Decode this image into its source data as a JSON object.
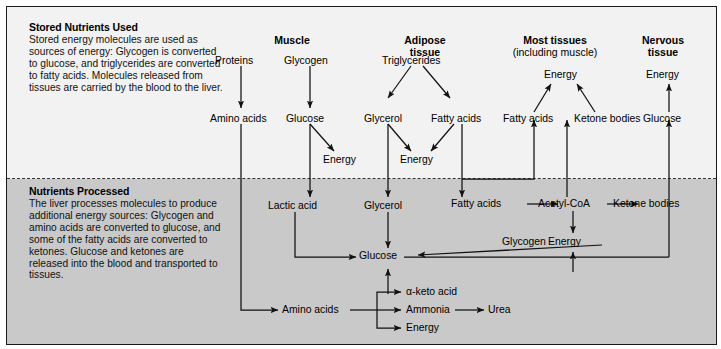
{
  "diagram": {
    "bands": {
      "top": {
        "heading": "Stored Nutrients Used",
        "body": "Stored energy molecules are used as sources of energy: Glycogen is converted to glucose, and triglycerides are converted to fatty acids. Molecules released from tissues are carried by the blood to the liver."
      },
      "bottom": {
        "heading": "Nutrients Processed",
        "body": "The liver processes molecules to produce additional energy sources: Glycogen and amino acids are converted to glucose, and some of the fatty acids are converted to ketones. Glucose and ketones are released into the blood and transported to tissues."
      }
    },
    "columns": [
      {
        "label": "Muscle",
        "sub": ""
      },
      {
        "label": "Adipose",
        "sub": "tissue"
      },
      {
        "label": "Most tissues",
        "sub": "(including muscle)"
      },
      {
        "label": "Nervous",
        "sub": "tissue"
      }
    ],
    "nodes": {
      "proteins": "Proteins",
      "glycogen_muscle": "Glycogen",
      "triglycerides": "Triglycerides",
      "energy_most": "Energy",
      "energy_nervous": "Energy",
      "amino_acids_top": "Amino acids",
      "glucose_muscle": "Glucose",
      "glycerol_top": "Glycerol",
      "fatty_acids_adipose": "Fatty acids",
      "fatty_acids_tissue": "Fatty acids",
      "ketone_bodies_tissue": "Ketone bodies",
      "glucose_nervous": "Glucose",
      "energy_glucose_muscle": "Energy",
      "energy_lipid": "Energy",
      "lactic_acid": "Lactic acid",
      "glycerol_liver": "Glycerol",
      "fatty_acids_liver": "Fatty acids",
      "acetyl_coa": "Acetyl-CoA",
      "ketone_bodies_liver": "Ketone bodies",
      "glycogen_liver": "Glycogen",
      "energy_liver": "Energy",
      "glucose_liver": "Glucose",
      "amino_acids_liver": "Amino acids",
      "alpha_keto_acid": "α-keto acid",
      "ammonia": "Ammonia",
      "urea": "Urea",
      "energy_amino": "Energy"
    }
  }
}
